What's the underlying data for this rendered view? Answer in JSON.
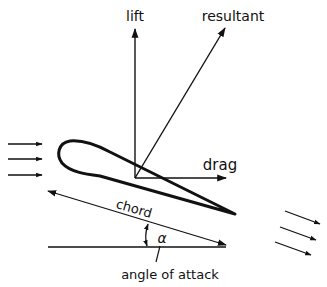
{
  "diagram": {
    "labels": {
      "lift": "lift",
      "resultant": "resultant",
      "drag": "drag",
      "chord": "chord",
      "alpha": "α",
      "angle_of_attack": "angle of attack"
    },
    "elements": [
      {
        "id": "airfoil",
        "type": "shape",
        "description": "airfoil cross-section"
      },
      {
        "id": "lift-vector",
        "type": "arrow",
        "direction": "up"
      },
      {
        "id": "resultant-vector",
        "type": "arrow",
        "direction": "up-right"
      },
      {
        "id": "drag-vector",
        "type": "arrow",
        "direction": "right"
      },
      {
        "id": "chord-line",
        "type": "double-arrow"
      },
      {
        "id": "horizontal-reference",
        "type": "line"
      },
      {
        "id": "angle-arc",
        "type": "double-arrow-arc"
      },
      {
        "id": "incoming-flow",
        "type": "arrows",
        "count": 3
      },
      {
        "id": "outgoing-flow",
        "type": "arrows",
        "count": 3
      }
    ],
    "colors": {
      "stroke": "#111111",
      "background": "#ffffff"
    }
  }
}
